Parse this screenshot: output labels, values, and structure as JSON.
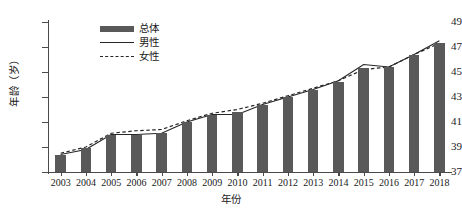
{
  "chart_data": {
    "type": "bar",
    "title": "",
    "xlabel": "年份",
    "ylabel": "年龄（岁）",
    "ylim": [
      37,
      49
    ],
    "ytick_labels": [
      "49",
      "47",
      "45",
      "43",
      "41",
      "39",
      "37"
    ],
    "ytick_values": [
      49,
      47,
      45,
      43,
      41,
      39,
      37
    ],
    "grid": false,
    "legend_position": "top-left-inside",
    "categories": [
      "2003",
      "2004",
      "2005",
      "2006",
      "2007",
      "2008",
      "2009",
      "2010",
      "2011",
      "2012",
      "2013",
      "2014",
      "2015",
      "2016",
      "2017",
      "2018"
    ],
    "series": [
      {
        "name": "总体",
        "type": "bar",
        "color": "#595959",
        "values": [
          38.4,
          38.9,
          40.0,
          40.0,
          40.1,
          41.0,
          41.6,
          41.8,
          42.4,
          43.0,
          43.6,
          44.2,
          45.3,
          45.4,
          46.4,
          47.3
        ]
      },
      {
        "name": "男性",
        "type": "line",
        "style": "solid",
        "color": "#262626",
        "values": [
          38.4,
          38.8,
          40.0,
          40.0,
          40.1,
          41.0,
          41.6,
          41.6,
          42.4,
          43.0,
          43.6,
          44.3,
          45.6,
          45.4,
          46.4,
          47.5
        ]
      },
      {
        "name": "女性",
        "type": "line",
        "style": "dashed",
        "color": "#262626",
        "values": [
          38.5,
          39.0,
          40.1,
          40.3,
          40.4,
          41.1,
          41.7,
          42.0,
          42.5,
          43.1,
          43.7,
          44.3,
          45.2,
          45.4,
          46.4,
          47.3
        ]
      }
    ]
  },
  "legend": {
    "items": [
      {
        "label": "总体",
        "marker": "bar-swatch"
      },
      {
        "label": "男性",
        "marker": "solid-line-swatch"
      },
      {
        "label": "女性",
        "marker": "dashed-line-swatch"
      }
    ]
  }
}
